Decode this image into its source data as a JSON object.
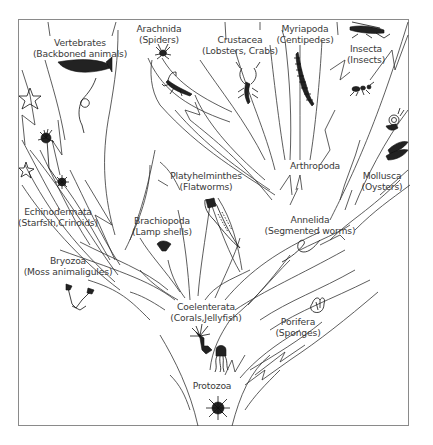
{
  "diagram": {
    "root": "Protozoa",
    "nodes": [
      {
        "id": "vertebrates",
        "name": "Vertebrates",
        "common": "(Backboned animals)"
      },
      {
        "id": "arachnida",
        "name": "Arachnida",
        "common": "(Spiders)"
      },
      {
        "id": "crustacea",
        "name": "Crustacea",
        "common": "(Lobsters, Crabs)"
      },
      {
        "id": "myriapoda",
        "name": "Myriapoda",
        "common": "(Centipedes)"
      },
      {
        "id": "insecta",
        "name": "Insecta",
        "common": "(Insects)"
      },
      {
        "id": "arthropoda",
        "name": "Arthropoda",
        "common": ""
      },
      {
        "id": "mollusca",
        "name": "Mollusca",
        "common": "(Oysters)"
      },
      {
        "id": "platyhelminthes",
        "name": "Platyhelminthes",
        "common": "(Flatworms)"
      },
      {
        "id": "echinodermata",
        "name": "Echinodermata",
        "common": "(Starfsih,Crinoids)"
      },
      {
        "id": "brachiopoda",
        "name": "Brachiopoda",
        "common": "(Lamp shells)"
      },
      {
        "id": "annelida",
        "name": "Annelida",
        "common": "(Segmented worms)"
      },
      {
        "id": "bryozoa",
        "name": "Bryozoa",
        "common": "(Moss animaligules)"
      },
      {
        "id": "coelenterata",
        "name": "Coelenterata",
        "common": "(Corals,Jellyfish)"
      },
      {
        "id": "porifera",
        "name": "Porifera",
        "common": "(Sponges)"
      },
      {
        "id": "protozoa",
        "name": "Protozoa",
        "common": ""
      }
    ],
    "edges": [
      [
        "protozoa",
        "coelenterata"
      ],
      [
        "protozoa",
        "porifera"
      ],
      [
        "coelenterata",
        "bryozoa"
      ],
      [
        "coelenterata",
        "brachiopoda"
      ],
      [
        "coelenterata",
        "echinodermata"
      ],
      [
        "coelenterata",
        "platyhelminthes"
      ],
      [
        "coelenterata",
        "annelida"
      ],
      [
        "echinodermata",
        "vertebrates"
      ],
      [
        "annelida",
        "arthropoda"
      ],
      [
        "annelida",
        "mollusca"
      ],
      [
        "arthropoda",
        "arachnida"
      ],
      [
        "arthropoda",
        "crustacea"
      ],
      [
        "arthropoda",
        "myriapoda"
      ],
      [
        "arthropoda",
        "insecta"
      ]
    ],
    "icons": [
      "fish-icon",
      "snake-icon",
      "starfish-icon",
      "crinoid-icon",
      "sea-urchin-icon",
      "spider-icon",
      "scorpion-icon",
      "lobster-icon",
      "centipede-icon",
      "grasshopper-icon",
      "ant-icon",
      "snail-icon",
      "oyster-icon",
      "flatworm-icon",
      "lamp-shell-icon",
      "worm-icon",
      "bryozoan-icon",
      "coral-icon",
      "jellyfish-icon",
      "sponge-icon",
      "amoeba-icon"
    ]
  },
  "colors": {
    "line": "#333333",
    "text": "#3a3a3a",
    "frame": "#8a8a8a",
    "background": "#ffffff"
  }
}
